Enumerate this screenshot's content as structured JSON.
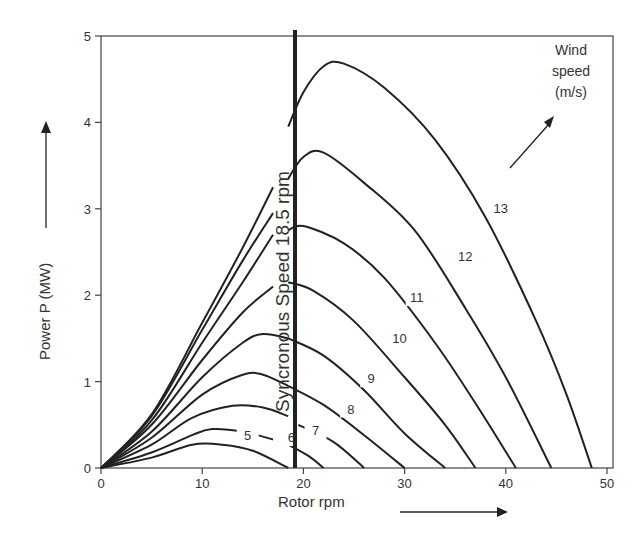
{
  "chart_data": {
    "type": "line",
    "title": "",
    "xlabel": "Rotor rpm",
    "ylabel": "Power P (MW)",
    "xlim": [
      0,
      50
    ],
    "ylim": [
      0,
      5
    ],
    "xticks": [
      0,
      10,
      20,
      30,
      40,
      50
    ],
    "yticks": [
      0,
      1,
      2,
      3,
      4,
      5
    ],
    "grid": false,
    "annotations": {
      "sync_line": {
        "x": 18.5,
        "label": "Syncronous Speed 18.5 rpm"
      },
      "wind_label": [
        "Wind",
        "speed",
        "(m/s)"
      ]
    },
    "series": [
      {
        "name": "5",
        "label": "5",
        "left": [
          [
            0,
            0
          ],
          [
            5,
            0.12
          ],
          [
            9,
            0.27
          ],
          [
            12,
            0.27
          ],
          [
            15,
            0.2
          ],
          [
            18.5,
            0
          ]
        ],
        "right": []
      },
      {
        "name": "6",
        "label": "6",
        "left": [
          [
            0,
            0
          ],
          [
            5,
            0.18
          ],
          [
            9,
            0.38
          ],
          [
            11,
            0.45
          ],
          [
            14,
            0.42
          ],
          [
            17,
            0.33
          ]
        ],
        "right": [
          [
            18.5,
            0.27
          ],
          [
            20.5,
            0.14
          ],
          [
            22,
            0
          ]
        ]
      },
      {
        "name": "7",
        "label": "7",
        "left": [
          [
            0,
            0
          ],
          [
            5,
            0.27
          ],
          [
            9,
            0.58
          ],
          [
            13,
            0.72
          ],
          [
            16,
            0.7
          ],
          [
            18.5,
            0.6
          ]
        ],
        "right": [
          [
            19.5,
            0.5
          ],
          [
            23,
            0.3
          ],
          [
            26,
            0
          ]
        ]
      },
      {
        "name": "8",
        "label": "8",
        "left": [
          [
            0,
            0
          ],
          [
            5,
            0.35
          ],
          [
            10,
            0.85
          ],
          [
            14,
            1.08
          ],
          [
            16,
            1.08
          ],
          [
            18.5,
            0.95
          ]
        ],
        "right": [
          [
            18.5,
            0.95
          ],
          [
            22,
            0.73
          ],
          [
            26,
            0.38
          ],
          [
            30,
            0
          ]
        ]
      },
      {
        "name": "9",
        "label": "9",
        "left": [
          [
            0,
            0
          ],
          [
            5,
            0.42
          ],
          [
            10,
            1.05
          ],
          [
            14,
            1.45
          ],
          [
            16,
            1.55
          ],
          [
            18.5,
            1.5
          ]
        ],
        "right": [
          [
            18.5,
            1.5
          ],
          [
            22,
            1.3
          ],
          [
            26,
            0.9
          ],
          [
            30,
            0.4
          ],
          [
            34,
            0
          ]
        ]
      },
      {
        "name": "10",
        "label": "10",
        "left": [
          [
            0,
            0
          ],
          [
            5,
            0.5
          ],
          [
            10,
            1.25
          ],
          [
            14,
            1.8
          ],
          [
            17,
            2.1
          ]
        ],
        "right": [
          [
            18.5,
            2.15
          ],
          [
            21,
            2.05
          ],
          [
            25,
            1.7
          ],
          [
            30,
            1.05
          ],
          [
            34,
            0.5
          ],
          [
            37,
            0
          ]
        ]
      },
      {
        "name": "11",
        "label": "11",
        "left": [
          [
            0,
            0
          ],
          [
            5,
            0.55
          ],
          [
            10,
            1.45
          ],
          [
            14,
            2.15
          ],
          [
            17,
            2.7
          ]
        ],
        "right": [
          [
            18.5,
            2.75
          ],
          [
            20,
            2.8
          ],
          [
            24,
            2.6
          ],
          [
            28,
            2.2
          ],
          [
            33,
            1.45
          ],
          [
            37,
            0.75
          ],
          [
            41,
            0
          ]
        ]
      },
      {
        "name": "12",
        "label": "12",
        "left": [
          [
            0,
            0
          ],
          [
            5,
            0.6
          ],
          [
            10,
            1.6
          ],
          [
            14,
            2.4
          ],
          [
            17,
            2.95
          ]
        ],
        "right": [
          [
            18.5,
            3.35
          ],
          [
            20,
            3.6
          ],
          [
            22,
            3.65
          ],
          [
            26,
            3.3
          ],
          [
            31,
            2.75
          ],
          [
            36,
            1.85
          ],
          [
            40,
            1.05
          ],
          [
            44.5,
            0
          ]
        ]
      },
      {
        "name": "13",
        "label": "13",
        "left": [
          [
            0,
            0
          ],
          [
            5,
            0.62
          ],
          [
            10,
            1.68
          ],
          [
            14,
            2.55
          ],
          [
            17,
            3.25
          ]
        ],
        "right": [
          [
            18.5,
            3.95
          ],
          [
            20,
            4.35
          ],
          [
            22,
            4.65
          ],
          [
            24,
            4.68
          ],
          [
            28,
            4.4
          ],
          [
            33,
            3.8
          ],
          [
            38,
            2.9
          ],
          [
            43,
            1.7
          ],
          [
            46,
            0.85
          ],
          [
            48.5,
            0
          ]
        ]
      }
    ]
  },
  "labels": {
    "wind_line1": "Wind",
    "wind_line2": "speed",
    "wind_line3": "(m/s)",
    "sync": "Syncronous Speed 18.5 rpm",
    "xlabel": "Rotor rpm",
    "ylabel": "Power P (MW)"
  }
}
